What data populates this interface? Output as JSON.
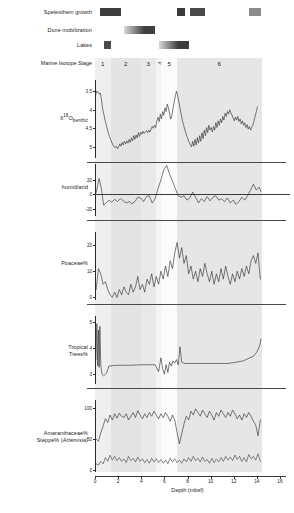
{
  "figure": {
    "xaxis": {
      "title": "Depth (mbsf)",
      "ticks": [
        0,
        2,
        4,
        6,
        8,
        10,
        12,
        14,
        16
      ],
      "min": 0,
      "max": 16
    },
    "event_rows": [
      {
        "label": "Speleothem growth",
        "bars": [
          {
            "start": 0.45,
            "end": 2.25,
            "shade": "#3d3d3d",
            "gradient": false
          },
          {
            "start": 7.05,
            "end": 7.75,
            "shade": "#3a3a3a",
            "gradient": false
          },
          {
            "start": 8.25,
            "end": 9.55,
            "shade": "#4a4a4a",
            "gradient": false
          },
          {
            "start": 13.3,
            "end": 14.35,
            "shade": "#8c8c8c",
            "gradient": false
          }
        ]
      },
      {
        "label": "Dune mobilization",
        "bars": [
          {
            "start": 2.55,
            "end": 5.2,
            "shade": "#3f3f3f",
            "gradient": true
          }
        ]
      },
      {
        "label": "Lakes",
        "bars": [
          {
            "start": 0.75,
            "end": 1.35,
            "shade": "#4a4a4a",
            "gradient": false
          },
          {
            "start": 5.5,
            "end": 8.1,
            "shade": "#3b3b3b",
            "gradient": true
          }
        ]
      }
    ],
    "mis": {
      "label": "Marine Isotope Stage",
      "stages": [
        {
          "name": "1",
          "start": 0.0,
          "end": 1.35,
          "rotated": false,
          "shade": "#efefef"
        },
        {
          "name": "2",
          "start": 1.35,
          "end": 3.95,
          "rotated": false,
          "shade": "#e4e4e4"
        },
        {
          "name": "3",
          "start": 3.95,
          "end": 5.25,
          "rotated": false,
          "shade": "#e9e9e9"
        },
        {
          "name": "4",
          "start": 5.25,
          "end": 5.75,
          "rotated": true,
          "shade": "#f4f4f4"
        },
        {
          "name": "5",
          "start": 5.75,
          "end": 7.1,
          "rotated": false,
          "shade": "#fbfbfb"
        },
        {
          "name": "6",
          "start": 7.1,
          "end": 14.4,
          "rotated": false,
          "shade": "#e6e6e6"
        }
      ]
    },
    "panels": [
      {
        "id": "d18o",
        "label_html": "δ<sup>18</sup>O<sub>benthic</sub>",
        "label_plain": "δ18O benthic",
        "yticks": [
          3.5,
          4,
          4.5,
          5
        ],
        "ymin": 3.2,
        "ymax": 5.3,
        "inverted": true,
        "zeroline": false
      },
      {
        "id": "humid_arid",
        "label_html": "humid/arid",
        "label_plain": "humid/arid",
        "yticks": [
          -20,
          0,
          20
        ],
        "ymin": -30,
        "ymax": 42,
        "inverted": false,
        "zeroline": true
      },
      {
        "id": "poaceae",
        "label_html": "Poaceae%",
        "label_plain": "Poaceae%",
        "yticks": [
          0,
          10,
          20
        ],
        "ymin": -1,
        "ymax": 25,
        "inverted": false,
        "zeroline": false
      },
      {
        "id": "tropical_trees",
        "label_html": "Tropical<br>Trees%",
        "label_plain": "Tropical Trees%",
        "yticks": [
          3,
          4,
          5
        ],
        "ymin": 2.6,
        "ymax": 5.25,
        "inverted": false,
        "zeroline": false
      },
      {
        "id": "amaranth_steppe",
        "label_html": "Amaranthaceae%<br>Steppe% (<i>Artemisia</i>)",
        "label_plain": "Amaranthaceae% Steppe% (Artemisia)",
        "yticks": [
          0,
          50,
          100
        ],
        "ymin": -3,
        "ymax": 112,
        "inverted": false,
        "zeroline": false
      }
    ]
  },
  "chart_data": [
    {
      "type": "line",
      "id": "d18o",
      "title": "",
      "xlabel": "Depth (mbsf)",
      "ylabel": "δ18O benthic",
      "xlim": [
        0,
        16
      ],
      "ylim": [
        5.3,
        3.2
      ],
      "axis_inverted_y": true,
      "yticks": [
        3.5,
        4,
        4.5,
        5
      ],
      "grid": false,
      "x": [
        0.05,
        0.15,
        0.25,
        0.35,
        0.45,
        0.55,
        0.65,
        0.75,
        0.85,
        0.95,
        1.05,
        1.15,
        1.25,
        1.35,
        1.45,
        1.55,
        1.65,
        1.75,
        1.85,
        1.95,
        2.05,
        2.15,
        2.25,
        2.35,
        2.45,
        2.55,
        2.65,
        2.75,
        2.85,
        2.95,
        3.05,
        3.15,
        3.25,
        3.35,
        3.45,
        3.55,
        3.65,
        3.75,
        3.85,
        3.95,
        4.05,
        4.15,
        4.25,
        4.35,
        4.45,
        4.55,
        4.65,
        4.75,
        4.85,
        4.95,
        5.05,
        5.15,
        5.25,
        5.35,
        5.45,
        5.55,
        5.65,
        5.75,
        5.85,
        5.95,
        6.05,
        6.15,
        6.25,
        6.35,
        6.45,
        6.55,
        6.65,
        6.75,
        6.85,
        6.95,
        7.05,
        7.15,
        7.25,
        7.35,
        7.45,
        7.55,
        7.65,
        7.75,
        7.85,
        7.95,
        8.05,
        8.15,
        8.25,
        8.35,
        8.45,
        8.55,
        8.65,
        8.75,
        8.85,
        8.95,
        9.05,
        9.15,
        9.25,
        9.35,
        9.45,
        9.55,
        9.65,
        9.75,
        9.85,
        9.95,
        10.05,
        10.15,
        10.25,
        10.35,
        10.45,
        10.55,
        10.65,
        10.75,
        10.85,
        10.95,
        11.05,
        11.15,
        11.25,
        11.35,
        11.45,
        11.55,
        11.65,
        11.75,
        11.85,
        11.95,
        12.05,
        12.15,
        12.25,
        12.35,
        12.45,
        12.55,
        12.65,
        12.75,
        12.85,
        12.95,
        13.05,
        13.15,
        13.25,
        13.35,
        13.45,
        13.55,
        13.65,
        13.75,
        13.85,
        13.95,
        14.05,
        14.15,
        14.25,
        14.35
      ],
      "y": [
        3.62,
        3.5,
        3.52,
        3.58,
        3.55,
        3.7,
        3.95,
        4.1,
        4.25,
        4.38,
        4.5,
        4.62,
        4.72,
        4.8,
        4.88,
        4.95,
        5.0,
        5.02,
        4.98,
        5.05,
        5.0,
        4.92,
        4.98,
        4.88,
        4.95,
        4.85,
        4.92,
        4.84,
        4.9,
        4.8,
        4.88,
        4.76,
        4.84,
        4.7,
        4.8,
        4.68,
        4.76,
        4.62,
        4.72,
        4.6,
        4.66,
        4.58,
        4.64,
        4.6,
        4.56,
        4.62,
        4.55,
        4.6,
        4.52,
        4.45,
        4.5,
        4.42,
        4.48,
        4.3,
        4.2,
        4.32,
        4.12,
        4.25,
        4.05,
        4.15,
        3.95,
        4.05,
        3.85,
        3.95,
        4.1,
        4.25,
        4.15,
        3.95,
        3.8,
        3.62,
        3.5,
        3.62,
        3.78,
        3.95,
        4.12,
        4.28,
        4.4,
        4.52,
        4.62,
        4.72,
        4.8,
        4.88,
        4.95,
        5.0,
        4.85,
        4.98,
        4.8,
        4.95,
        4.75,
        4.9,
        4.7,
        4.85,
        4.62,
        4.78,
        4.55,
        4.7,
        4.48,
        4.62,
        4.42,
        4.55,
        4.48,
        4.6,
        4.45,
        4.55,
        4.35,
        4.48,
        4.3,
        4.42,
        4.25,
        4.35,
        4.18,
        4.28,
        4.1,
        4.18,
        4.05,
        4.12,
        4.0,
        4.08,
        4.15,
        4.22,
        4.3,
        4.2,
        4.28,
        4.18,
        4.32,
        4.25,
        4.38,
        4.3,
        4.42,
        4.35,
        4.48,
        4.4,
        4.52,
        4.45,
        4.55,
        4.48,
        4.42,
        4.3,
        4.18,
        4.05,
        3.92
      ]
    },
    {
      "type": "line",
      "id": "humid_arid",
      "title": "",
      "xlabel": "Depth (mbsf)",
      "ylabel": "humid/arid",
      "xlim": [
        0,
        16
      ],
      "ylim": [
        -30,
        42
      ],
      "yticks": [
        -20,
        0,
        20
      ],
      "reference_line": 0,
      "grid": false,
      "x": [
        0.1,
        0.35,
        0.55,
        0.75,
        0.95,
        1.2,
        1.45,
        1.7,
        1.95,
        2.2,
        2.45,
        2.7,
        2.95,
        3.2,
        3.45,
        3.7,
        3.95,
        4.2,
        4.45,
        4.7,
        4.95,
        5.2,
        5.45,
        5.7,
        5.95,
        6.2,
        6.45,
        6.7,
        6.95,
        7.2,
        7.45,
        7.7,
        7.95,
        8.2,
        8.45,
        8.7,
        8.95,
        9.2,
        9.45,
        9.7,
        9.95,
        10.2,
        10.45,
        10.7,
        10.95,
        11.2,
        11.45,
        11.7,
        11.95,
        12.2,
        12.45,
        12.7,
        12.95,
        13.2,
        13.45,
        13.7,
        13.95,
        14.2,
        14.35
      ],
      "y": [
        2,
        22,
        8,
        -15,
        -12,
        -8,
        -11,
        -7,
        -10,
        -6,
        -9,
        -12,
        -10,
        -13,
        -10,
        -4,
        -5,
        -10,
        -3,
        -2,
        -12,
        -6,
        8,
        20,
        34,
        40,
        28,
        18,
        8,
        -2,
        -4,
        -2,
        -8,
        -5,
        3,
        -4,
        -12,
        -6,
        -10,
        -3,
        -9,
        -4,
        -2,
        -8,
        -6,
        -10,
        -5,
        -12,
        -8,
        -14,
        -10,
        -4,
        -8,
        -2,
        6,
        14,
        6,
        10,
        4
      ]
    },
    {
      "type": "line",
      "id": "poaceae",
      "title": "",
      "xlabel": "Depth (mbsf)",
      "ylabel": "Poaceae%",
      "xlim": [
        0,
        16
      ],
      "ylim": [
        -1,
        25
      ],
      "yticks": [
        0,
        10,
        20
      ],
      "grid": false,
      "x": [
        0.1,
        0.3,
        0.5,
        0.7,
        0.9,
        1.1,
        1.3,
        1.5,
        1.7,
        1.9,
        2.1,
        2.3,
        2.5,
        2.7,
        2.9,
        3.1,
        3.3,
        3.5,
        3.7,
        3.9,
        4.1,
        4.3,
        4.5,
        4.7,
        4.9,
        5.1,
        5.3,
        5.5,
        5.7,
        5.9,
        6.1,
        6.3,
        6.5,
        6.7,
        6.9,
        7.1,
        7.3,
        7.5,
        7.7,
        7.9,
        8.1,
        8.3,
        8.5,
        8.7,
        8.9,
        9.1,
        9.3,
        9.5,
        9.7,
        9.9,
        10.1,
        10.3,
        10.5,
        10.7,
        10.9,
        11.1,
        11.3,
        11.5,
        11.7,
        11.9,
        12.1,
        12.3,
        12.5,
        12.7,
        12.9,
        13.1,
        13.3,
        13.5,
        13.7,
        13.9,
        14.1,
        14.3
      ],
      "y": [
        3,
        11,
        9,
        5,
        6,
        3,
        1,
        0,
        2,
        0,
        3,
        1,
        4,
        2,
        1,
        5,
        2,
        4,
        8,
        3,
        5,
        2,
        7,
        5,
        9,
        4,
        8,
        5,
        10,
        7,
        12,
        8,
        14,
        11,
        17,
        21,
        15,
        19,
        13,
        16,
        9,
        12,
        7,
        10,
        6,
        11,
        8,
        13,
        9,
        6,
        10,
        5,
        9,
        6,
        11,
        7,
        12,
        8,
        5,
        9,
        6,
        10,
        7,
        11,
        8,
        12,
        9,
        14,
        16,
        13,
        17,
        7
      ]
    },
    {
      "type": "line",
      "id": "tropical_trees",
      "title": "",
      "xlabel": "Depth (mbsf)",
      "ylabel": "Tropical Trees%",
      "xlim": [
        0,
        16
      ],
      "ylim": [
        2.6,
        5.25
      ],
      "yticks": [
        3,
        4,
        5
      ],
      "grid": false,
      "x": [
        0.08,
        0.16,
        0.24,
        0.3,
        0.36,
        0.42,
        0.5,
        0.58,
        0.66,
        0.74,
        0.82,
        0.9,
        1.0,
        1.2,
        1.6,
        2.2,
        3.0,
        4.0,
        4.6,
        5.2,
        5.5,
        5.7,
        5.85,
        6.0,
        6.15,
        6.3,
        6.45,
        6.6,
        6.75,
        6.9,
        7.05,
        7.2,
        7.35,
        7.5,
        7.65,
        7.8,
        8.5,
        9.5,
        10.5,
        11.5,
        12.2,
        12.8,
        13.3,
        13.7,
        14.0,
        14.25,
        14.35
      ],
      "y": [
        3.55,
        4.95,
        3.3,
        4.7,
        3.25,
        4.85,
        3.35,
        3.05,
        2.95,
        2.92,
        2.95,
        2.98,
        3.02,
        3.3,
        3.32,
        3.33,
        3.33,
        3.35,
        3.35,
        3.35,
        3.08,
        3.62,
        3.2,
        2.98,
        3.35,
        3.05,
        3.45,
        3.3,
        3.5,
        3.42,
        3.55,
        3.35,
        4.05,
        3.45,
        3.42,
        3.4,
        3.4,
        3.4,
        3.4,
        3.4,
        3.45,
        3.5,
        3.6,
        3.68,
        3.85,
        4.1,
        4.35
      ]
    },
    {
      "type": "line",
      "id": "amaranthaceae",
      "series_name": "Amaranthaceae%",
      "title": "",
      "xlabel": "Depth (mbsf)",
      "ylabel": "Amaranthaceae%",
      "xlim": [
        0,
        16
      ],
      "ylim": [
        -3,
        112
      ],
      "yticks": [
        0,
        50,
        100
      ],
      "grid": false,
      "x": [
        0.1,
        0.3,
        0.5,
        0.7,
        0.9,
        1.1,
        1.3,
        1.5,
        1.7,
        1.9,
        2.1,
        2.3,
        2.5,
        2.7,
        2.9,
        3.1,
        3.3,
        3.5,
        3.7,
        3.9,
        4.1,
        4.3,
        4.5,
        4.7,
        4.9,
        5.1,
        5.3,
        5.5,
        5.7,
        5.9,
        6.1,
        6.3,
        6.5,
        6.7,
        6.9,
        7.1,
        7.3,
        7.5,
        7.7,
        7.9,
        8.1,
        8.3,
        8.5,
        8.7,
        8.9,
        9.1,
        9.3,
        9.5,
        9.7,
        9.9,
        10.1,
        10.3,
        10.5,
        10.7,
        10.9,
        11.1,
        11.3,
        11.5,
        11.7,
        11.9,
        12.1,
        12.3,
        12.5,
        12.7,
        12.9,
        13.1,
        13.3,
        13.5,
        13.7,
        13.9,
        14.1,
        14.3
      ],
      "y": [
        50,
        46,
        60,
        70,
        82,
        76,
        88,
        80,
        90,
        83,
        91,
        86,
        84,
        90,
        80,
        86,
        92,
        84,
        95,
        88,
        82,
        90,
        84,
        92,
        86,
        94,
        88,
        82,
        90,
        84,
        92,
        86,
        78,
        88,
        80,
        60,
        42,
        58,
        74,
        86,
        80,
        94,
        88,
        98,
        92,
        86,
        96,
        90,
        84,
        94,
        88,
        80,
        92,
        86,
        96,
        90,
        84,
        92,
        86,
        96,
        90,
        82,
        88,
        80,
        90,
        84,
        92,
        86,
        78,
        72,
        55,
        80
      ]
    },
    {
      "type": "line",
      "id": "steppe_artemisia",
      "series_name": "Steppe% (Artemisia)",
      "title": "",
      "xlabel": "Depth (mbsf)",
      "ylabel": "Steppe% (Artemisia)",
      "xlim": [
        0,
        16
      ],
      "ylim": [
        -3,
        112
      ],
      "yticks": [
        0,
        50,
        100
      ],
      "grid": false,
      "x": [
        0.1,
        0.3,
        0.5,
        0.7,
        0.9,
        1.1,
        1.3,
        1.5,
        1.7,
        1.9,
        2.1,
        2.3,
        2.5,
        2.7,
        2.9,
        3.1,
        3.3,
        3.5,
        3.7,
        3.9,
        4.1,
        4.3,
        4.5,
        4.7,
        4.9,
        5.1,
        5.3,
        5.5,
        5.7,
        5.9,
        6.1,
        6.3,
        6.5,
        6.7,
        6.9,
        7.1,
        7.3,
        7.5,
        7.7,
        7.9,
        8.1,
        8.3,
        8.5,
        8.7,
        8.9,
        9.1,
        9.3,
        9.5,
        9.7,
        9.9,
        10.1,
        10.3,
        10.5,
        10.7,
        10.9,
        11.1,
        11.3,
        11.5,
        11.7,
        11.9,
        12.1,
        12.3,
        12.5,
        12.7,
        12.9,
        13.1,
        13.3,
        13.5,
        13.7,
        13.9,
        14.1,
        14.3
      ],
      "y": [
        10,
        8,
        14,
        10,
        20,
        14,
        24,
        16,
        22,
        15,
        20,
        14,
        18,
        12,
        22,
        15,
        19,
        13,
        21,
        14,
        18,
        12,
        17,
        11,
        19,
        13,
        18,
        12,
        17,
        11,
        16,
        10,
        19,
        13,
        18,
        12,
        16,
        11,
        18,
        13,
        20,
        14,
        22,
        15,
        19,
        13,
        21,
        14,
        17,
        11,
        19,
        12,
        18,
        13,
        20,
        14,
        22,
        16,
        21,
        15,
        24,
        17,
        22,
        14,
        20,
        13,
        25,
        18,
        22,
        16,
        26,
        14
      ]
    }
  ]
}
